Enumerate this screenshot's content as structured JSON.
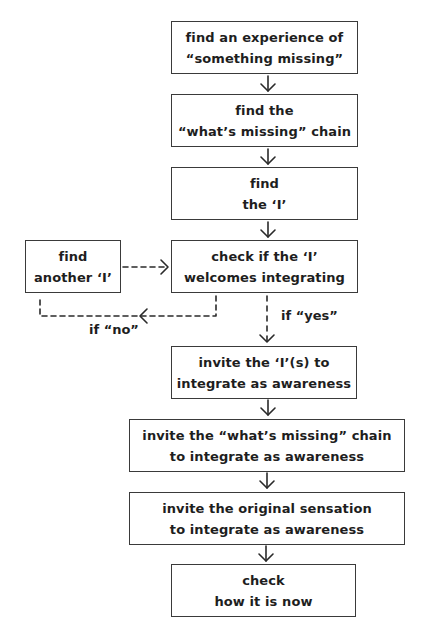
{
  "diagram": {
    "type": "flowchart",
    "nodes": [
      {
        "id": "n1",
        "lines": [
          "find an experience of",
          "“something missing”"
        ]
      },
      {
        "id": "n2",
        "lines": [
          "find the",
          "“what’s missing” chain"
        ]
      },
      {
        "id": "n3",
        "lines": [
          "find",
          "the ‘I’"
        ]
      },
      {
        "id": "n4",
        "lines": [
          "check if the ‘I’",
          "welcomes integrating"
        ]
      },
      {
        "id": "side",
        "lines": [
          "find",
          "another ‘I’"
        ]
      },
      {
        "id": "n5",
        "lines": [
          "invite the ‘I’(s) to",
          "integrate as awareness"
        ]
      },
      {
        "id": "n6",
        "lines": [
          "invite the “what’s missing” chain",
          "to integrate as awareness"
        ]
      },
      {
        "id": "n7",
        "lines": [
          "invite the original sensation",
          "to integrate as awareness"
        ]
      },
      {
        "id": "n8",
        "lines": [
          "check",
          "how it is now"
        ]
      }
    ],
    "edge_labels": {
      "yes": "if “yes”",
      "no": "if “no”"
    },
    "edges": [
      {
        "from": "n1",
        "to": "n2",
        "style": "solid"
      },
      {
        "from": "n2",
        "to": "n3",
        "style": "solid"
      },
      {
        "from": "n3",
        "to": "n4",
        "style": "solid"
      },
      {
        "from": "n4",
        "to": "n5",
        "style": "dashed",
        "label": "if “yes”"
      },
      {
        "from": "n4",
        "to": "side",
        "style": "dashed",
        "label": "if “no”"
      },
      {
        "from": "side",
        "to": "n4",
        "style": "dashed"
      },
      {
        "from": "n5",
        "to": "n6",
        "style": "solid"
      },
      {
        "from": "n6",
        "to": "n7",
        "style": "solid"
      },
      {
        "from": "n7",
        "to": "n8",
        "style": "solid"
      }
    ]
  }
}
